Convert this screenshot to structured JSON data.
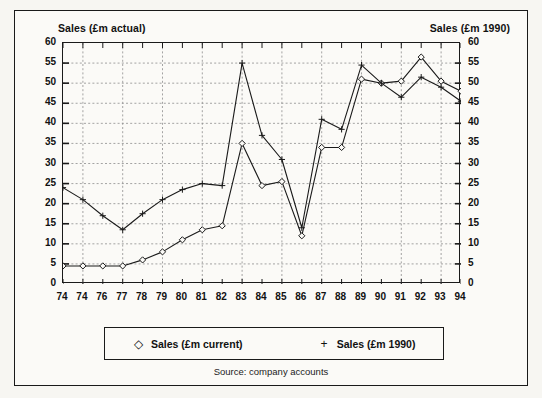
{
  "figure": {
    "left_axis_title": "Sales (£m actual)",
    "right_axis_title": "Sales (£m 1990)",
    "source_note": "Source: company accounts",
    "frame_color": "#1a1a1a",
    "background_color": "#fbfaf7"
  },
  "legend": {
    "entries": [
      {
        "marker": "diamond-marker",
        "glyph": "◇",
        "label": "Sales (£m current)"
      },
      {
        "marker": "plus-marker",
        "glyph": "+",
        "label": "Sales (£m 1990)"
      }
    ]
  },
  "chart_data": {
    "type": "line",
    "title": "",
    "xlabel": "",
    "ylabel": "Sales (£m actual)",
    "ylabel_right": "Sales (£m 1990)",
    "grid": true,
    "legend_position": "bottom",
    "xlim": [
      0,
      20
    ],
    "ylim": [
      0,
      60
    ],
    "ytick_values": [
      0,
      5,
      10,
      15,
      20,
      25,
      30,
      35,
      40,
      45,
      50,
      55,
      60
    ],
    "ytick_labels": [
      "0",
      "5",
      "10",
      "15",
      "20",
      "25",
      "30",
      "35",
      "40",
      "45",
      "50",
      "55",
      "60"
    ],
    "ytick_labels_right": [
      "0",
      "5",
      "10",
      "15",
      "20",
      "25",
      "30",
      "35",
      "40",
      "45",
      "50",
      "55",
      "60"
    ],
    "categories": [
      "74",
      "74",
      "76",
      "77",
      "78",
      "79",
      "80",
      "81",
      "82",
      "83",
      "84",
      "85",
      "86",
      "87",
      "88",
      "89",
      "90",
      "91",
      "92",
      "93",
      "94"
    ],
    "series": [
      {
        "name": "Sales (£m current)",
        "marker": "diamond",
        "values": [
          4.5,
          4.5,
          4.5,
          4.5,
          6.0,
          8.0,
          11.0,
          13.5,
          14.5,
          35.0,
          24.5,
          25.5,
          12.0,
          34.0,
          34.0,
          51.0,
          50.0,
          50.5,
          56.5,
          50.5,
          48.0
        ]
      },
      {
        "name": "Sales (£m 1990)",
        "marker": "plus",
        "values": [
          24.0,
          21.0,
          17.0,
          13.5,
          17.5,
          21.0,
          23.5,
          25.0,
          24.5,
          55.0,
          37.0,
          31.0,
          14.0,
          41.0,
          38.5,
          54.5,
          50.0,
          46.5,
          51.5,
          49.0,
          45.5
        ]
      }
    ]
  }
}
